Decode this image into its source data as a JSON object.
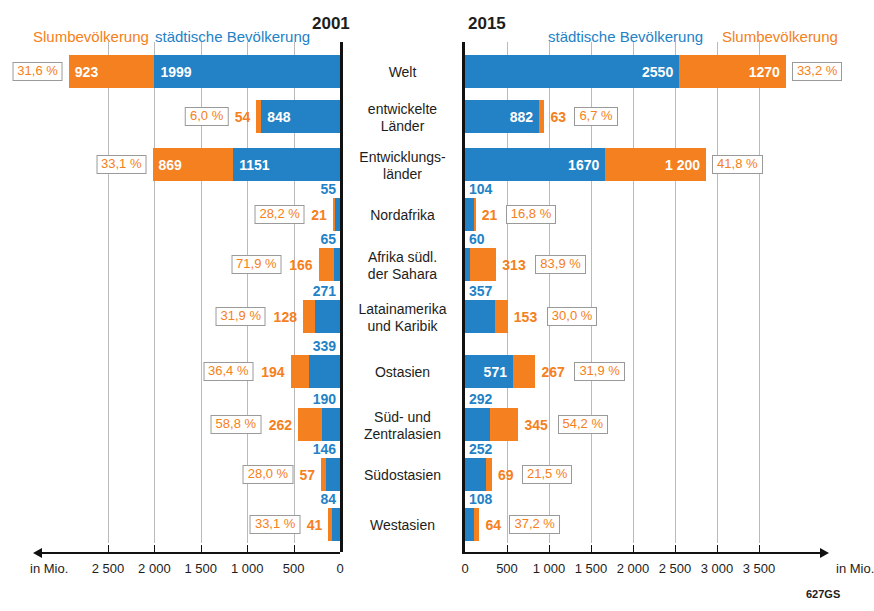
{
  "meta": {
    "source_code": "627GS"
  },
  "panels": {
    "left": {
      "year": "2001",
      "legend_slum": "Slumbevölkerung",
      "legend_urban": "städtische Bevölkerung",
      "axis_unit": "in Mio.",
      "ticks": [
        "2 500",
        "2 000",
        "1 500",
        "1 000",
        "500",
        "0"
      ],
      "tick_values": [
        2500,
        2000,
        1500,
        1000,
        500,
        0
      ],
      "direction": "right-to-left"
    },
    "right": {
      "year": "2015",
      "legend_urban": "städtische Bevölkerung",
      "legend_slum": "Slumbevölkerung",
      "axis_unit": "in Mio.",
      "ticks": [
        "0",
        "500",
        "1 000",
        "1 500",
        "2 000",
        "2 500",
        "3 000",
        "3 500"
      ],
      "tick_values": [
        0,
        500,
        1000,
        1500,
        2000,
        2500,
        3000,
        3500
      ],
      "direction": "left-to-right"
    }
  },
  "colors": {
    "urban": "#2382c6",
    "slum": "#f58020",
    "axis": "#111111",
    "grid": "#b9babc"
  },
  "chart_data": {
    "type": "bar",
    "xlabel": "in Mio.",
    "ylabel": "",
    "orientation": "horizontal-diverging",
    "xlim_left": [
      0,
      2900
    ],
    "xlim_right": [
      0,
      3800
    ],
    "grid": true,
    "legend": [
      "städtische Bevölkerung",
      "Slumbevölkerung"
    ],
    "categories": [
      "Welt",
      "entwickelte Länder",
      "Entwicklungsländer",
      "Nordafrika",
      "Afrika südl. der Sahara",
      "Latainamerika und Karibik",
      "Ostasien",
      "Süd- und Zentralasien",
      "Südostasien",
      "Westasien"
    ],
    "series": [
      {
        "name": "2001 städtische Bevölkerung",
        "unit": "Mio.",
        "values": [
          1999,
          848,
          1151,
          55,
          65,
          271,
          339,
          190,
          146,
          84
        ]
      },
      {
        "name": "2001 Slumbevölkerung",
        "unit": "Mio.",
        "values": [
          923,
          54,
          869,
          21,
          166,
          128,
          194,
          262,
          57,
          41
        ]
      },
      {
        "name": "2001 Slumanteil",
        "unit": "%",
        "values": [
          "31,6 %",
          "6,0 %",
          "33,1 %",
          "28,2 %",
          "71,9 %",
          "31,9 %",
          "36,4 %",
          "58,8 %",
          "28,0 %",
          "33,1 %"
        ]
      },
      {
        "name": "2015 städtische Bevölkerung",
        "unit": "Mio.",
        "values": [
          2550,
          882,
          1670,
          104,
          60,
          357,
          571,
          292,
          252,
          108
        ]
      },
      {
        "name": "2015 Slumbevölkerung",
        "unit": "Mio.",
        "values": [
          1270,
          63,
          1200,
          21,
          313,
          153,
          267,
          345,
          69,
          64
        ]
      },
      {
        "name": "2015 Slumanteil",
        "unit": "%",
        "values": [
          "33,2 %",
          "6,7 %",
          "41,8 %",
          "16,8 %",
          "83,9 %",
          "30,0 %",
          "31,9 %",
          "54,2 %",
          "21,5 %",
          "37,2 %"
        ]
      }
    ]
  },
  "rows": [
    {
      "label_line1": "Welt",
      "label_line2": "",
      "left": {
        "urban": "1999",
        "slum": "923",
        "pct": "31,6 %"
      },
      "right": {
        "urban": "2550",
        "slum": "1270",
        "pct": "33,2 %"
      }
    },
    {
      "label_line1": "entwickelte",
      "label_line2": "Länder",
      "left": {
        "urban": "848",
        "slum": "54",
        "pct": "6,0 %"
      },
      "right": {
        "urban": "882",
        "slum": "63",
        "pct": "6,7 %"
      }
    },
    {
      "label_line1": "Entwicklungs-",
      "label_line2": "länder",
      "left": {
        "urban": "1151",
        "slum": "869",
        "pct": "33,1 %"
      },
      "right": {
        "urban": "1670",
        "slum": "1 200",
        "pct": "41,8 %"
      }
    },
    {
      "label_line1": "Nordafrika",
      "label_line2": "",
      "left": {
        "urban": "55",
        "slum": "21",
        "pct": "28,2 %"
      },
      "right": {
        "urban": "104",
        "slum": "21",
        "pct": "16,8 %"
      }
    },
    {
      "label_line1": "Afrika südl.",
      "label_line2": "der Sahara",
      "left": {
        "urban": "65",
        "slum": "166",
        "pct": "71,9 %"
      },
      "right": {
        "urban": "60",
        "slum": "313",
        "pct": "83,9 %"
      }
    },
    {
      "label_line1": "Latainamerika",
      "label_line2": "und Karibik",
      "left": {
        "urban": "271",
        "slum": "128",
        "pct": "31,9 %"
      },
      "right": {
        "urban": "357",
        "slum": "153",
        "pct": "30,0 %"
      }
    },
    {
      "label_line1": "Ostasien",
      "label_line2": "",
      "left": {
        "urban": "339",
        "slum": "194",
        "pct": "36,4 %"
      },
      "right": {
        "urban": "571",
        "slum": "267",
        "pct": "31,9 %"
      }
    },
    {
      "label_line1": "Süd- und",
      "label_line2": "Zentralasien",
      "left": {
        "urban": "190",
        "slum": "262",
        "pct": "58,8 %"
      },
      "right": {
        "urban": "292",
        "slum": "345",
        "pct": "54,2 %"
      }
    },
    {
      "label_line1": "Südostasien",
      "label_line2": "",
      "left": {
        "urban": "146",
        "slum": "57",
        "pct": "28,0 %"
      },
      "right": {
        "urban": "252",
        "slum": "69",
        "pct": "21,5 %"
      }
    },
    {
      "label_line1": "Westasien",
      "label_line2": "",
      "left": {
        "urban": "84",
        "slum": "41",
        "pct": "33,1 %"
      },
      "right": {
        "urban": "108",
        "slum": "64",
        "pct": "37,2 %"
      }
    }
  ]
}
